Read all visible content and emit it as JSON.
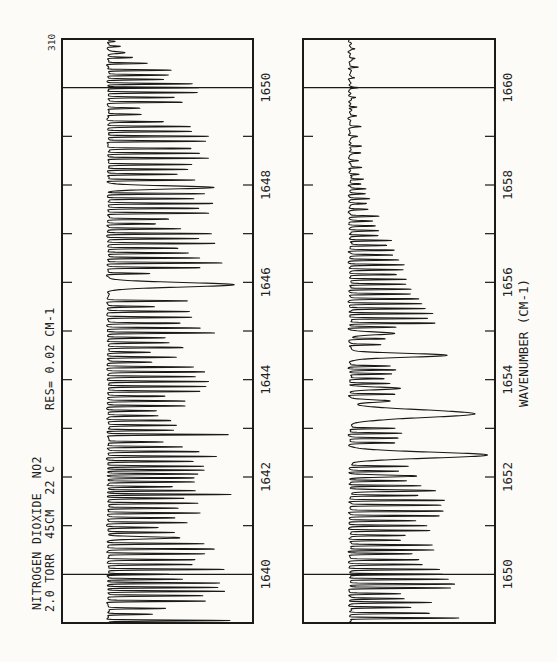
{
  "page": {
    "number": "310"
  },
  "header": {
    "title": "NITROGEN DIOXIDE  NO2",
    "conditions": "2.0 TORR  45CM  22 C",
    "resolution": "RES= 0.02 CM-1"
  },
  "ink_color": "#1a1a18",
  "paper_color": "#fcfbf8",
  "chart_data": [
    {
      "type": "line",
      "panel": "upper",
      "description": "IR transmittance spectrum of NO2, dense rotational line forest",
      "xlabel": "",
      "ylabel": "",
      "x_range": [
        1639.0,
        1651.0
      ],
      "x_tick_step": 1,
      "x_tick_labels": [
        1640,
        1642,
        1644,
        1646,
        1648,
        1650
      ],
      "gridlines_at": [
        1640,
        1650
      ],
      "grid": "edge lines only",
      "baseline_px": 108,
      "max_depth_px": 139,
      "default_line_sigma_cm1": 0.013,
      "noise_amp_px": 1.2,
      "absorption_lines": [
        [
          1639.05,
          122
        ],
        [
          1639.18,
          45
        ],
        [
          1639.3,
          58
        ],
        [
          1639.45,
          100
        ],
        [
          1639.56,
          96
        ],
        [
          1639.65,
          118
        ],
        [
          1639.73,
          110
        ],
        [
          1639.82,
          112
        ],
        [
          1639.9,
          75
        ],
        [
          1640.0,
          62
        ],
        [
          1640.1,
          118
        ],
        [
          1640.2,
          85
        ],
        [
          1640.3,
          88
        ],
        [
          1640.42,
          98
        ],
        [
          1640.52,
          108
        ],
        [
          1640.63,
          95
        ],
        [
          1640.75,
          72,
          0.03
        ],
        [
          1640.86,
          66
        ],
        [
          1640.96,
          50
        ],
        [
          1641.06,
          80
        ],
        [
          1641.16,
          66
        ],
        [
          1641.26,
          94
        ],
        [
          1641.36,
          72
        ],
        [
          1641.46,
          90
        ],
        [
          1641.56,
          78
        ],
        [
          1641.64,
          122
        ],
        [
          1641.72,
          88
        ],
        [
          1641.8,
          66
        ],
        [
          1641.9,
          88
        ],
        [
          1641.98,
          86
        ],
        [
          1642.06,
          90
        ],
        [
          1642.14,
          98
        ],
        [
          1642.22,
          96
        ],
        [
          1642.32,
          86
        ],
        [
          1642.42,
          108
        ],
        [
          1642.52,
          92
        ],
        [
          1642.62,
          76
        ],
        [
          1642.72,
          56
        ],
        [
          1642.87,
          124
        ],
        [
          1642.96,
          66
        ],
        [
          1643.06,
          70
        ],
        [
          1643.16,
          64
        ],
        [
          1643.26,
          50
        ],
        [
          1643.36,
          48
        ],
        [
          1643.46,
          78
        ],
        [
          1643.56,
          76
        ],
        [
          1643.66,
          58
        ],
        [
          1643.76,
          94
        ],
        [
          1643.86,
          98
        ],
        [
          1643.96,
          103
        ],
        [
          1644.06,
          88
        ],
        [
          1644.16,
          96
        ],
        [
          1644.26,
          86
        ],
        [
          1644.36,
          44
        ],
        [
          1644.46,
          68
        ],
        [
          1644.56,
          44
        ],
        [
          1644.66,
          76
        ],
        [
          1644.76,
          62
        ],
        [
          1644.86,
          58
        ],
        [
          1644.96,
          107
        ],
        [
          1645.06,
          92
        ],
        [
          1645.16,
          72
        ],
        [
          1645.28,
          84
        ],
        [
          1645.4,
          82
        ],
        [
          1645.5,
          46
        ],
        [
          1645.62,
          80
        ],
        [
          1645.95,
          126,
          0.065
        ],
        [
          1646.18,
          42
        ],
        [
          1646.3,
          92
        ],
        [
          1646.4,
          116
        ],
        [
          1646.5,
          92
        ],
        [
          1646.6,
          82
        ],
        [
          1646.7,
          72
        ],
        [
          1646.8,
          106
        ],
        [
          1646.9,
          92
        ],
        [
          1647.0,
          104
        ],
        [
          1647.1,
          72
        ],
        [
          1647.2,
          48
        ],
        [
          1647.3,
          62
        ],
        [
          1647.42,
          102
        ],
        [
          1647.52,
          92
        ],
        [
          1647.62,
          106
        ],
        [
          1647.72,
          88
        ],
        [
          1647.82,
          96
        ],
        [
          1647.95,
          106,
          0.045
        ],
        [
          1648.1,
          88
        ],
        [
          1648.22,
          70
        ],
        [
          1648.32,
          82
        ],
        [
          1648.42,
          84
        ],
        [
          1648.55,
          102
        ],
        [
          1648.65,
          92
        ],
        [
          1648.75,
          86
        ],
        [
          1648.9,
          98
        ],
        [
          1649.0,
          102
        ],
        [
          1649.1,
          86
        ],
        [
          1649.2,
          82
        ],
        [
          1649.3,
          56
        ],
        [
          1649.45,
          34
        ],
        [
          1649.58,
          33
        ],
        [
          1649.7,
          76
        ],
        [
          1649.8,
          66
        ],
        [
          1649.9,
          92
        ],
        [
          1650.0,
          92
        ],
        [
          1650.08,
          84
        ],
        [
          1650.17,
          56
        ],
        [
          1650.26,
          62
        ],
        [
          1650.36,
          64
        ],
        [
          1650.5,
          40
        ],
        [
          1650.62,
          24
        ],
        [
          1650.72,
          18,
          0.025
        ],
        [
          1650.85,
          12
        ],
        [
          1650.95,
          8
        ]
      ]
    },
    {
      "type": "line",
      "panel": "lower",
      "description": "IR transmittance spectrum of NO2, band head region with two strong broad features near 1652.45 and 1653.3",
      "xlabel": "WAVENUMBER (CM-1)",
      "ylabel": "",
      "x_range": [
        1649.0,
        1661.0
      ],
      "x_tick_step": 1,
      "x_tick_labels": [
        1650,
        1652,
        1654,
        1656,
        1658,
        1660
      ],
      "gridlines_at": [
        1650,
        1660
      ],
      "grid": "edge lines only",
      "baseline_px": 350,
      "max_depth_px": 141,
      "default_line_sigma_cm1": 0.013,
      "noise_amp_px": 1.6,
      "absorption_lines": [
        [
          1649.1,
          112
        ],
        [
          1649.2,
          80
        ],
        [
          1649.32,
          62
        ],
        [
          1649.42,
          82
        ],
        [
          1649.5,
          54
        ],
        [
          1649.6,
          50
        ],
        [
          1649.72,
          100
        ],
        [
          1649.8,
          106
        ],
        [
          1649.9,
          100
        ],
        [
          1650.0,
          94
        ],
        [
          1650.1,
          90
        ],
        [
          1650.2,
          72
        ],
        [
          1650.3,
          68
        ],
        [
          1650.42,
          62
        ],
        [
          1650.5,
          84
        ],
        [
          1650.6,
          84
        ],
        [
          1650.7,
          52
        ],
        [
          1650.8,
          56
        ],
        [
          1650.9,
          80
        ],
        [
          1651.0,
          78
        ],
        [
          1651.1,
          64
        ],
        [
          1651.2,
          90
        ],
        [
          1651.3,
          95
        ],
        [
          1651.42,
          92
        ],
        [
          1651.52,
          95
        ],
        [
          1651.62,
          70
        ],
        [
          1651.72,
          86,
          0.022
        ],
        [
          1651.82,
          72
        ],
        [
          1651.92,
          56
        ],
        [
          1652.02,
          66,
          0.028
        ],
        [
          1652.12,
          48
        ],
        [
          1652.22,
          58
        ],
        [
          1652.45,
          137,
          0.085
        ],
        [
          1652.7,
          44
        ],
        [
          1652.8,
          48
        ],
        [
          1652.9,
          52
        ],
        [
          1653.0,
          46
        ],
        [
          1653.3,
          124,
          0.11
        ],
        [
          1653.56,
          40,
          0.035
        ],
        [
          1653.7,
          46
        ],
        [
          1653.82,
          50,
          0.035
        ],
        [
          1653.92,
          40
        ],
        [
          1654.02,
          36
        ],
        [
          1654.12,
          42
        ],
        [
          1654.2,
          46
        ],
        [
          1654.28,
          40
        ],
        [
          1654.5,
          98,
          0.055
        ],
        [
          1654.72,
          32
        ],
        [
          1654.84,
          36
        ],
        [
          1654.95,
          44,
          0.04
        ],
        [
          1655.08,
          46
        ],
        [
          1655.16,
          86
        ],
        [
          1655.26,
          80
        ],
        [
          1655.36,
          83
        ],
        [
          1655.46,
          76
        ],
        [
          1655.56,
          72
        ],
        [
          1655.66,
          68
        ],
        [
          1655.76,
          60
        ],
        [
          1655.86,
          63
        ],
        [
          1655.96,
          56
        ],
        [
          1656.06,
          58
        ],
        [
          1656.16,
          48
        ],
        [
          1656.26,
          52
        ],
        [
          1656.36,
          55
        ],
        [
          1656.46,
          48
        ],
        [
          1656.56,
          42
        ],
        [
          1656.66,
          45
        ],
        [
          1656.76,
          38
        ],
        [
          1656.86,
          42
        ],
        [
          1656.96,
          30
        ],
        [
          1657.06,
          28
        ],
        [
          1657.16,
          25
        ],
        [
          1657.26,
          22
        ],
        [
          1657.36,
          28
        ],
        [
          1657.5,
          18
        ],
        [
          1657.62,
          15
        ],
        [
          1657.72,
          20
        ],
        [
          1657.82,
          14
        ],
        [
          1657.92,
          16
        ],
        [
          1658.02,
          12
        ],
        [
          1658.12,
          14
        ],
        [
          1658.22,
          10
        ],
        [
          1658.36,
          12
        ],
        [
          1658.5,
          8
        ],
        [
          1658.66,
          10
        ],
        [
          1658.8,
          13
        ],
        [
          1659.0,
          7
        ],
        [
          1659.2,
          9
        ],
        [
          1659.42,
          6
        ],
        [
          1659.6,
          8
        ],
        [
          1659.8,
          5
        ],
        [
          1660.0,
          7
        ],
        [
          1660.2,
          5
        ],
        [
          1660.42,
          9
        ],
        [
          1660.6,
          5
        ],
        [
          1660.8,
          4
        ]
      ]
    }
  ]
}
